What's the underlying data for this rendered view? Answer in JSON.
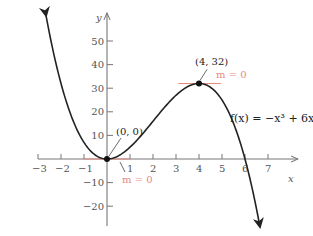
{
  "chart_data": {
    "type": "line",
    "title": "",
    "xlabel": "x",
    "ylabel": "y",
    "function": "f(x) = -x^3 + 6x^2",
    "function_label": "f(x) = −x³ + 6x²",
    "xlim": [
      -3.5,
      7.6
    ],
    "ylim": [
      -27,
      60
    ],
    "x_ticks": [
      -3,
      -2,
      -1,
      1,
      2,
      3,
      4,
      5,
      6,
      7
    ],
    "y_ticks": [
      -20,
      -10,
      10,
      20,
      30,
      40,
      50
    ],
    "grid": false,
    "series": [
      {
        "name": "f(x) = -x^3 + 6x^2",
        "x": [
          -2.65,
          -2,
          -1,
          0,
          1,
          2,
          3,
          4,
          5,
          6,
          6.65
        ],
        "y": [
          60.7,
          32,
          7,
          0,
          5,
          16,
          27,
          32,
          25,
          0,
          -28.7
        ]
      }
    ],
    "points": [
      {
        "label": "(0, 0)",
        "x": 0,
        "y": 0,
        "slope_label": "m = 0"
      },
      {
        "label": "(4, 32)",
        "x": 4,
        "y": 32,
        "slope_label": "m = 0"
      }
    ]
  },
  "colors": {
    "curve": "#222222",
    "axis": "#777777",
    "tangent": "#e88a80"
  }
}
